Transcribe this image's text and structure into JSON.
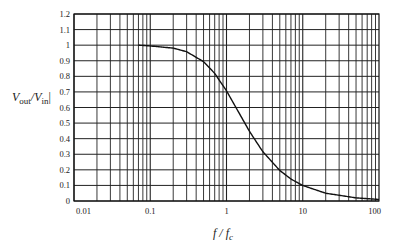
{
  "chart_data": {
    "type": "line",
    "title": "",
    "xlabel": "f / f_c",
    "ylabel": "|V_out / V_in|",
    "xscale": "log",
    "xlim": [
      0.01,
      100
    ],
    "ylim": [
      0,
      1.2
    ],
    "grid": true,
    "x_ticks": [
      "0.01",
      "0.1",
      "1",
      "10",
      "100"
    ],
    "y_ticks": [
      "0",
      "0.1",
      "0.2",
      "0.3",
      "0.4",
      "0.5",
      "0.6",
      "0.7",
      "0.8",
      "0.9",
      "1",
      "1.1",
      "1.2"
    ],
    "series": [
      {
        "name": "Low-pass magnitude response",
        "x": [
          0.07,
          0.1,
          0.2,
          0.3,
          0.5,
          0.7,
          1,
          1.5,
          2,
          3,
          5,
          7,
          10,
          20,
          50,
          100
        ],
        "values": [
          1.0,
          0.995,
          0.981,
          0.958,
          0.894,
          0.819,
          0.707,
          0.555,
          0.447,
          0.316,
          0.196,
          0.141,
          0.0995,
          0.05,
          0.02,
          0.01
        ]
      }
    ],
    "legend": null
  },
  "labels": {
    "y_main": "V",
    "y_sub_out": "out",
    "y_slash": "/V",
    "y_sub_in": "in",
    "y_bar": "|",
    "x_main": "f / f",
    "x_sub": "c"
  }
}
